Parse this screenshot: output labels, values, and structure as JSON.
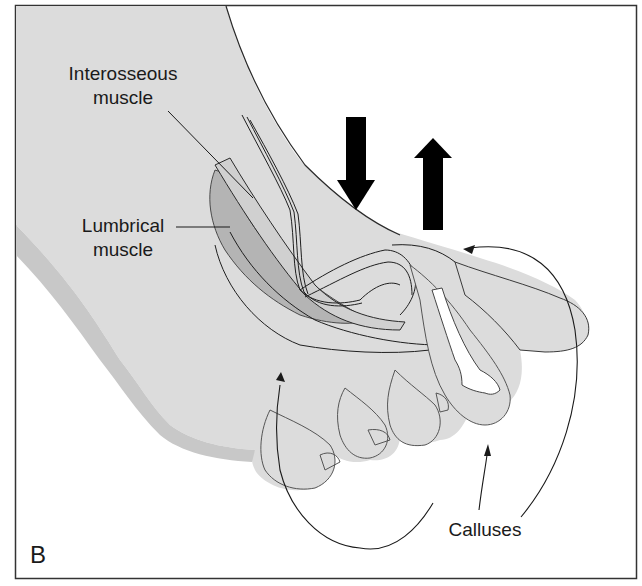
{
  "figure": {
    "panel_letter": "B",
    "colors": {
      "skin": "#dcdcdc",
      "skin_shadow": "#c4c4c4",
      "muscle": "#a8a8a8",
      "outline": "#2a2a2a",
      "bone": "#ffffff",
      "background": "#ffffff",
      "frame": "#333333",
      "arrow": "#000000"
    },
    "labels": {
      "interosseous_line1": "Interosseous",
      "interosseous_line2": "muscle",
      "lumbrical_line1": "Lumbrical",
      "lumbrical_line2": "muscle",
      "calluses": "Calluses"
    },
    "arrows": [
      {
        "name": "downward-force",
        "direction": "down"
      },
      {
        "name": "upward-force",
        "direction": "up"
      }
    ]
  }
}
